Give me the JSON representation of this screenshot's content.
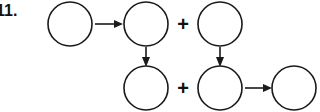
{
  "diagram": {
    "item_number": "11.",
    "operator_top": "+",
    "operator_bottom": "+",
    "stroke_color": "#1a1a1a",
    "fill_color": "#ffffff",
    "background_color": "#ffffff",
    "nodes": [
      {
        "id": "node-top-1",
        "label": "",
        "cx": 70,
        "cy": 24,
        "r": 22
      },
      {
        "id": "node-top-2",
        "label": "",
        "cx": 146,
        "cy": 24,
        "r": 22
      },
      {
        "id": "node-top-3",
        "label": "",
        "cx": 220,
        "cy": 24,
        "r": 22
      },
      {
        "id": "node-bottom-1",
        "label": "",
        "cx": 146,
        "cy": 88,
        "r": 22
      },
      {
        "id": "node-bottom-2",
        "label": "",
        "cx": 220,
        "cy": 88,
        "r": 22
      },
      {
        "id": "node-bottom-3",
        "label": "",
        "cx": 294,
        "cy": 88,
        "r": 22
      }
    ],
    "arrows": [
      {
        "id": "arrow-top-1-to-top-2",
        "from": "node-top-1",
        "to": "node-top-2",
        "direction": "right"
      },
      {
        "id": "arrow-top-2-to-bottom-1",
        "from": "node-top-2",
        "to": "node-bottom-1",
        "direction": "down"
      },
      {
        "id": "arrow-top-3-to-bottom-2",
        "from": "node-top-3",
        "to": "node-bottom-2",
        "direction": "down"
      },
      {
        "id": "arrow-bottom-2-to-bottom-3",
        "from": "node-bottom-2",
        "to": "node-bottom-3",
        "direction": "right"
      }
    ]
  }
}
